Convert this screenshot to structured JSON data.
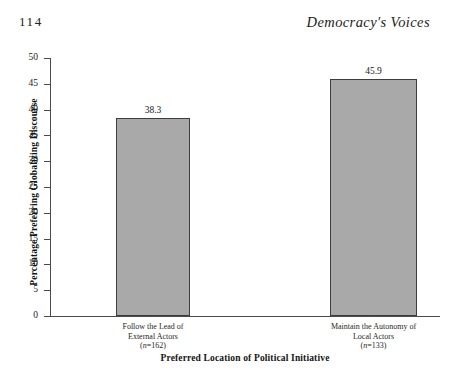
{
  "page": {
    "number": "114",
    "running_head": "Democracy's Voices"
  },
  "chart_data": {
    "type": "bar",
    "title": "",
    "xlabel": "Preferred Location of Political Initiative",
    "ylabel": "Percentage Preferring Globalizing Discourse",
    "ylim": [
      0,
      50
    ],
    "ytick_step": 5,
    "yticks": [
      "0",
      "5",
      "10",
      "15",
      "20",
      "25",
      "30",
      "35",
      "40",
      "45",
      "50"
    ],
    "grid": false,
    "legend": "none",
    "bar_fill_color": "#a9a9a9",
    "bar_border_color": "#3d3d3d",
    "axis_color": "#4a4a4a",
    "categories": [
      "Follow the Lead of External Actors",
      "Maintain the Autonomy of Local Actors"
    ],
    "category_lines": [
      [
        "Follow the Lead of",
        "External Actors"
      ],
      [
        "Maintain the Autonomy of",
        "Local Actors"
      ]
    ],
    "sample_sizes": [
      "(n=162)",
      "(n=133)"
    ],
    "sample_n_values": [
      162,
      133
    ],
    "values": [
      38.3,
      45.9
    ],
    "value_labels": [
      "38.3",
      "45.9"
    ]
  }
}
